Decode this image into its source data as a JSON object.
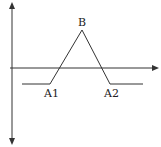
{
  "diagram": {
    "labels": {
      "peak": "B",
      "left_base": "A1",
      "right_base": "A2"
    },
    "colors": {
      "line": "#333333",
      "background": "#ffffff"
    },
    "axes": {
      "vertical": "double-headed arrow",
      "horizontal": "right-pointing arrow"
    },
    "shape": {
      "type": "piecewise-linear",
      "points": [
        [
          22,
          84
        ],
        [
          50,
          84
        ],
        [
          82,
          30
        ],
        [
          110,
          84
        ],
        [
          143,
          84
        ]
      ]
    }
  }
}
